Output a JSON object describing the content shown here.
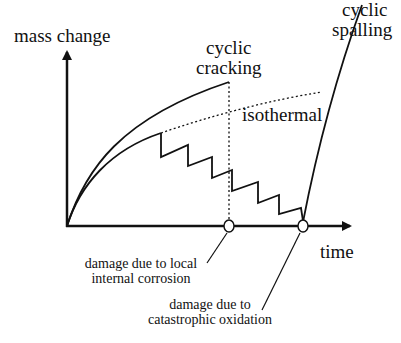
{
  "diagram": {
    "y_axis_label": "mass change",
    "x_axis_label": "time",
    "curves": {
      "cyclic_cracking": {
        "line1": "cyclic",
        "line2": "cracking"
      },
      "isothermal": "isothermal",
      "cyclic_spalling": {
        "line1": "cyclic",
        "line2": "spalling"
      }
    },
    "annotations": {
      "local_internal_corrosion": {
        "line1": "damage due to local",
        "line2": "internal corrosion"
      },
      "catastrophic_oxidation": {
        "line1": "damage due to",
        "line2": "catastrophic oxidation"
      }
    },
    "colors": {
      "line": "#111111",
      "background": "#ffffff"
    }
  }
}
